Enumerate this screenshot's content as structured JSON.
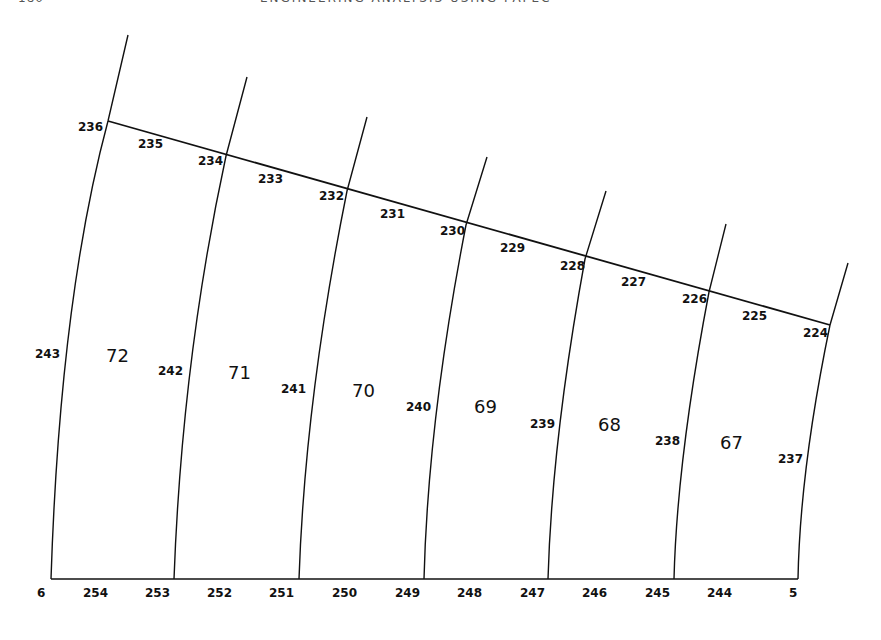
{
  "header": {
    "page_number": "180",
    "title": "ENGINEERING ANALYSIS USING PAFEC"
  },
  "diagram": {
    "top_edge_nodes": [
      "236",
      "235",
      "234",
      "233",
      "232",
      "231",
      "230",
      "229",
      "228",
      "227",
      "226",
      "225",
      "224"
    ],
    "side_midside_nodes": [
      "243",
      "242",
      "241",
      "240",
      "239",
      "238",
      "237"
    ],
    "bottom_edge_nodes": [
      "6",
      "254",
      "253",
      "252",
      "251",
      "250",
      "249",
      "248",
      "247",
      "246",
      "245",
      "244",
      "5"
    ],
    "elements": [
      "72",
      "71",
      "70",
      "69",
      "68",
      "67"
    ]
  }
}
